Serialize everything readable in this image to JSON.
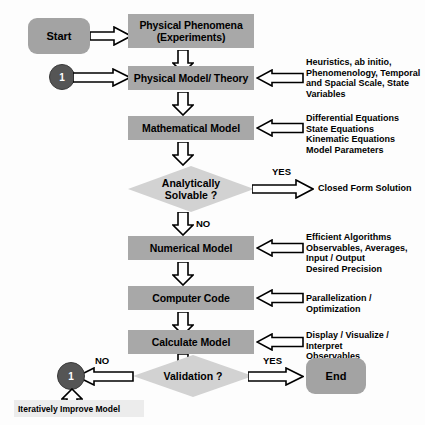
{
  "diagram": {
    "background_color": "#fdfdfd",
    "box_fill": "#a8a8a8",
    "terminator_fill": "#a3a3a3",
    "diamond_fill": "#d2d2d2",
    "circle_fill": "#555555",
    "arrow_fill": "#ffffff",
    "arrow_stroke": "#000000"
  },
  "nodes": {
    "start": "Start",
    "physical_phenomena": "Physical Phenomena\n(Experiments)",
    "physical_phenomena_line1": "Physical Phenomena",
    "physical_phenomena_line2": "(Experiments)",
    "connector_top": "1",
    "physical_model": "Physical Model/ Theory",
    "mathematical_model": "Mathematical Model",
    "analytically_solvable_line1": "Analytically",
    "analytically_solvable_line2": "Solvable ?",
    "closed_form_solution": "Closed Form Solution",
    "numerical_model": "Numerical Model",
    "computer_code": "Computer Code",
    "calculate_model": "Calculate Model",
    "validation": "Validation ?",
    "connector_bottom": "1",
    "end": "End",
    "iteratively_improve_model": "Iteratively Improve Model"
  },
  "annotations": {
    "physical_model_inputs": "Heuristics, ab initio,\nPhenomenology, Temporal\nand Spacial Scale, State\nVariables",
    "mathematical_model_inputs": "Differential Equations\nState Equations\nKinematic Equations\nModel Parameters",
    "numerical_model_inputs": "Efficient Algorithms\nObservables, Averages,\nInput / Output\nDesired Precision",
    "computer_code_inputs": "Parallelization / Optimization",
    "calculate_model_inputs": "Display / Visualize / Interpret\nObservables"
  },
  "edge_labels": {
    "solvable_yes": "YES",
    "solvable_no": "NO",
    "validation_yes": "YES",
    "validation_no": "NO"
  }
}
